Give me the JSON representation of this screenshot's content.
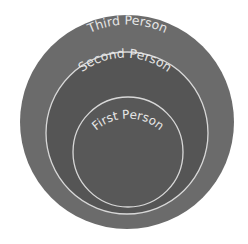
{
  "diagram": {
    "type": "nested-circles",
    "circles": [
      {
        "id": "outer",
        "label": "Third Person",
        "fill": "#6b6b6b",
        "stroke": "#6b6b6b",
        "cx": 127,
        "cy": 122,
        "r": 107
      },
      {
        "id": "middle",
        "label": "Second Person",
        "fill": "#555555",
        "stroke": "#d8d8d8",
        "cx": 127,
        "cy": 133,
        "r": 81
      },
      {
        "id": "inner",
        "label": "First Person",
        "fill": "#585858",
        "stroke": "#d8d8d8",
        "cx": 128,
        "cy": 152,
        "r": 55
      }
    ],
    "label_color": "#e6e6e6",
    "background": "#ffffff"
  }
}
